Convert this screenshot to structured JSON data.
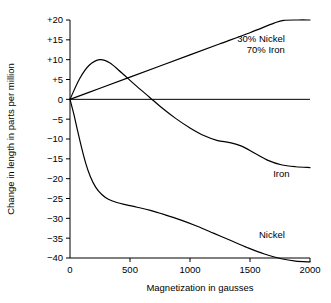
{
  "chart_data": {
    "type": "line",
    "title": "",
    "xlabel": "Magnetization in gausses",
    "ylabel": "Change in length in parts per million",
    "xlim": [
      0,
      2000
    ],
    "ylim": [
      -40,
      20
    ],
    "xticks": [
      0,
      500,
      1000,
      1500,
      2000
    ],
    "xtick_labels": [
      "0",
      "500",
      "1000",
      "1500",
      "2000"
    ],
    "yticks": [
      20,
      15,
      10,
      5,
      0,
      -5,
      -10,
      -15,
      -20,
      -25,
      -30,
      -35,
      -40
    ],
    "ytick_labels": [
      "+20",
      "+15",
      "+10",
      "+5",
      "0",
      "−5",
      "−10",
      "−15",
      "−20",
      "−25",
      "−30",
      "−35",
      "−40"
    ],
    "grid": false,
    "legend_position": "inline-right-annotations",
    "series": [
      {
        "name": "30% Nickel 70% Iron",
        "label_lines": [
          "30% Nickel",
          "70% Iron"
        ],
        "label_x": 1790,
        "label_y": 14.5,
        "points": [
          [
            0,
            0
          ],
          [
            250,
            2.8
          ],
          [
            500,
            5.6
          ],
          [
            750,
            8.4
          ],
          [
            1000,
            11.2
          ],
          [
            1250,
            14.0
          ],
          [
            1500,
            16.8
          ],
          [
            1700,
            19.2
          ],
          [
            1780,
            19.9
          ],
          [
            1900,
            20.0
          ],
          [
            2000,
            20.0
          ]
        ]
      },
      {
        "name": "Iron",
        "label_lines": [
          "Iron"
        ],
        "label_x": 1830,
        "label_y": -19.5,
        "points": [
          [
            0,
            0
          ],
          [
            80,
            5.2
          ],
          [
            160,
            8.6
          ],
          [
            250,
            10.0
          ],
          [
            330,
            9.2
          ],
          [
            430,
            6.7
          ],
          [
            540,
            3.7
          ],
          [
            660,
            0.6
          ],
          [
            760,
            -2.0
          ],
          [
            880,
            -4.8
          ],
          [
            1000,
            -7.2
          ],
          [
            1120,
            -9.2
          ],
          [
            1230,
            -10.4
          ],
          [
            1330,
            -10.9
          ],
          [
            1430,
            -11.8
          ],
          [
            1540,
            -13.6
          ],
          [
            1650,
            -15.4
          ],
          [
            1760,
            -16.5
          ],
          [
            1880,
            -17.0
          ],
          [
            2000,
            -17.2
          ]
        ]
      },
      {
        "name": "Nickel",
        "label_lines": [
          "Nickel"
        ],
        "label_x": 1790,
        "label_y": -35.0,
        "points": [
          [
            0,
            0
          ],
          [
            30,
            -3.5
          ],
          [
            60,
            -7.5
          ],
          [
            95,
            -12.0
          ],
          [
            130,
            -16.0
          ],
          [
            170,
            -19.5
          ],
          [
            215,
            -22.2
          ],
          [
            265,
            -24.0
          ],
          [
            320,
            -25.2
          ],
          [
            390,
            -26.0
          ],
          [
            470,
            -26.6
          ],
          [
            560,
            -27.2
          ],
          [
            670,
            -28.0
          ],
          [
            790,
            -29.1
          ],
          [
            920,
            -30.4
          ],
          [
            1060,
            -32.0
          ],
          [
            1200,
            -33.8
          ],
          [
            1340,
            -35.6
          ],
          [
            1480,
            -37.4
          ],
          [
            1620,
            -39.0
          ],
          [
            1760,
            -40.2
          ],
          [
            1880,
            -40.8
          ],
          [
            2000,
            -41.0
          ]
        ]
      }
    ]
  },
  "plot_geometry": {
    "left": 70,
    "right": 310,
    "top": 20,
    "bottom": 258
  },
  "colors": {
    "axis": "#000000",
    "curve": "#000000",
    "background": "#ffffff"
  }
}
